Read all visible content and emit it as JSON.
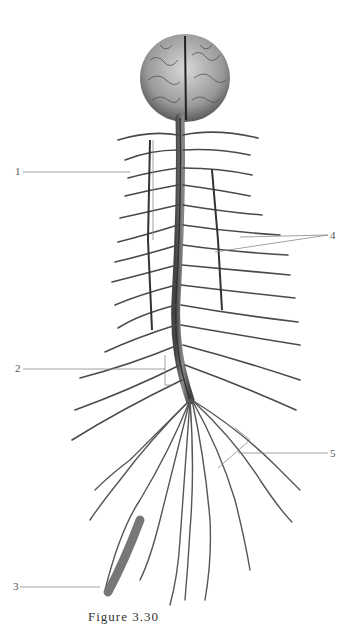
{
  "figure": {
    "caption": "Figure 3.30",
    "labels": [
      {
        "id": "1",
        "text": "1",
        "x": 15,
        "y": 165
      },
      {
        "id": "2",
        "text": "2",
        "x": 15,
        "y": 362
      },
      {
        "id": "3",
        "text": "3",
        "x": 13,
        "y": 583
      },
      {
        "id": "4",
        "text": "4",
        "x": 330,
        "y": 231
      },
      {
        "id": "5",
        "text": "5",
        "x": 330,
        "y": 448
      }
    ],
    "colors": {
      "background": "#ffffff",
      "leader_line": "#888888",
      "tissue_dark": "#3a3a3a",
      "tissue_light": "#bdbdbd"
    }
  }
}
